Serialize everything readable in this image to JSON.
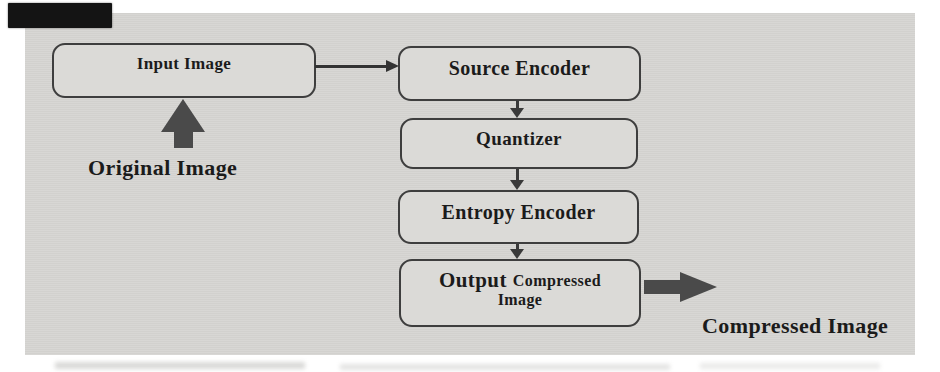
{
  "figure": {
    "type": "flowchart",
    "nodes": {
      "input": {
        "label": "Input Image"
      },
      "source": {
        "label": "Source Encoder"
      },
      "quantizer": {
        "label": "Quantizer"
      },
      "entropy": {
        "label": "Entropy Encoder"
      },
      "output": {
        "label_primary": "Output",
        "label_secondary": "Compressed",
        "label_secondary_line2": "Image"
      }
    },
    "labels": {
      "original": "Original Image",
      "compressed": "Compressed Image"
    },
    "edges": [
      {
        "from": "original_image_label",
        "to": "input",
        "style": "thick-up-arrow"
      },
      {
        "from": "input",
        "to": "source",
        "style": "thin-right-arrow"
      },
      {
        "from": "source",
        "to": "quantizer",
        "style": "thin-down-arrow"
      },
      {
        "from": "quantizer",
        "to": "entropy",
        "style": "thin-down-arrow"
      },
      {
        "from": "entropy",
        "to": "output",
        "style": "thin-down-arrow"
      },
      {
        "from": "output",
        "to": "compressed_image_label",
        "style": "thick-right-arrow"
      }
    ],
    "colors": {
      "panel_bg": "#d7d6d3",
      "box_fill": "#dbdad7",
      "box_border": "#3e3e3e",
      "text": "#1b1b1b",
      "thin_arrow": "#333333",
      "thick_arrow": "#4a4a4a",
      "scan_artifact": "#141414"
    }
  }
}
